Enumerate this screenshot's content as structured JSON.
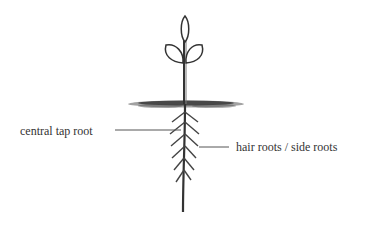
{
  "diagram": {
    "labels": {
      "tap_root": "central tap root",
      "hair_roots": "hair roots / side roots"
    }
  }
}
